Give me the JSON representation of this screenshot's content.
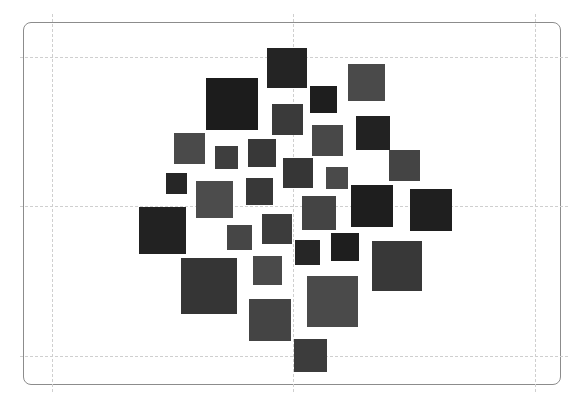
{
  "canvas": {
    "width": 585,
    "height": 408,
    "background": "#ffffff",
    "frame": {
      "x": 23,
      "y": 22,
      "width": 538,
      "height": 363,
      "radius": 8,
      "border_color": "#8c8c8c"
    },
    "guides": {
      "color": "#cfcfcf",
      "horizontal_y": [
        57,
        206,
        356
      ],
      "vertical_x": [
        52,
        293,
        535
      ]
    }
  },
  "squares": [
    {
      "x": 206,
      "y": 78,
      "size": 52,
      "color": "#1c1c1c"
    },
    {
      "x": 267,
      "y": 48,
      "size": 40,
      "color": "#242424"
    },
    {
      "x": 348,
      "y": 64,
      "size": 37,
      "color": "#4a4a4a"
    },
    {
      "x": 310,
      "y": 86,
      "size": 27,
      "color": "#1e1e1e"
    },
    {
      "x": 272,
      "y": 104,
      "size": 31,
      "color": "#3a3a3a"
    },
    {
      "x": 174,
      "y": 133,
      "size": 31,
      "color": "#4a4a4a"
    },
    {
      "x": 215,
      "y": 146,
      "size": 23,
      "color": "#3e3e3e"
    },
    {
      "x": 248,
      "y": 139,
      "size": 28,
      "color": "#383838"
    },
    {
      "x": 312,
      "y": 125,
      "size": 31,
      "color": "#484848"
    },
    {
      "x": 356,
      "y": 116,
      "size": 34,
      "color": "#222222"
    },
    {
      "x": 283,
      "y": 158,
      "size": 30,
      "color": "#363636"
    },
    {
      "x": 389,
      "y": 150,
      "size": 31,
      "color": "#444444"
    },
    {
      "x": 166,
      "y": 173,
      "size": 21,
      "color": "#262626"
    },
    {
      "x": 196,
      "y": 181,
      "size": 37,
      "color": "#4c4c4c"
    },
    {
      "x": 246,
      "y": 178,
      "size": 27,
      "color": "#383838"
    },
    {
      "x": 326,
      "y": 167,
      "size": 22,
      "color": "#4a4a4a"
    },
    {
      "x": 351,
      "y": 185,
      "size": 42,
      "color": "#1e1e1e"
    },
    {
      "x": 410,
      "y": 189,
      "size": 42,
      "color": "#1f1f1f"
    },
    {
      "x": 302,
      "y": 196,
      "size": 34,
      "color": "#444444"
    },
    {
      "x": 139,
      "y": 207,
      "size": 47,
      "color": "#222222"
    },
    {
      "x": 227,
      "y": 225,
      "size": 25,
      "color": "#464646"
    },
    {
      "x": 262,
      "y": 214,
      "size": 30,
      "color": "#3c3c3c"
    },
    {
      "x": 295,
      "y": 240,
      "size": 25,
      "color": "#262626"
    },
    {
      "x": 331,
      "y": 233,
      "size": 28,
      "color": "#1e1e1e"
    },
    {
      "x": 181,
      "y": 258,
      "size": 56,
      "color": "#353535"
    },
    {
      "x": 253,
      "y": 256,
      "size": 29,
      "color": "#4a4a4a"
    },
    {
      "x": 372,
      "y": 241,
      "size": 50,
      "color": "#383838"
    },
    {
      "x": 249,
      "y": 299,
      "size": 42,
      "color": "#444444"
    },
    {
      "x": 307,
      "y": 276,
      "size": 51,
      "color": "#4a4a4a"
    },
    {
      "x": 294,
      "y": 339,
      "size": 33,
      "color": "#3c3c3c"
    }
  ]
}
